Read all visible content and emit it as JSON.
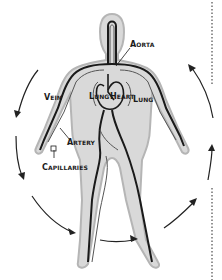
{
  "diagram": {
    "type": "circulatory-system",
    "labels": {
      "aorta": "Aorta",
      "vein": "Vein",
      "lung_left": "Lung",
      "heart": "Heart",
      "lung_right": "Lung",
      "artery": "Artery",
      "capillaries": "Capillaries"
    },
    "colors": {
      "body_fill": "#d9d9d9",
      "body_outline": "#b5b5b5",
      "vessel": "#1a1a1a",
      "arrow": "#222222",
      "dots": "#666666"
    },
    "flow_direction": "counter-clockwise arrows around body"
  }
}
